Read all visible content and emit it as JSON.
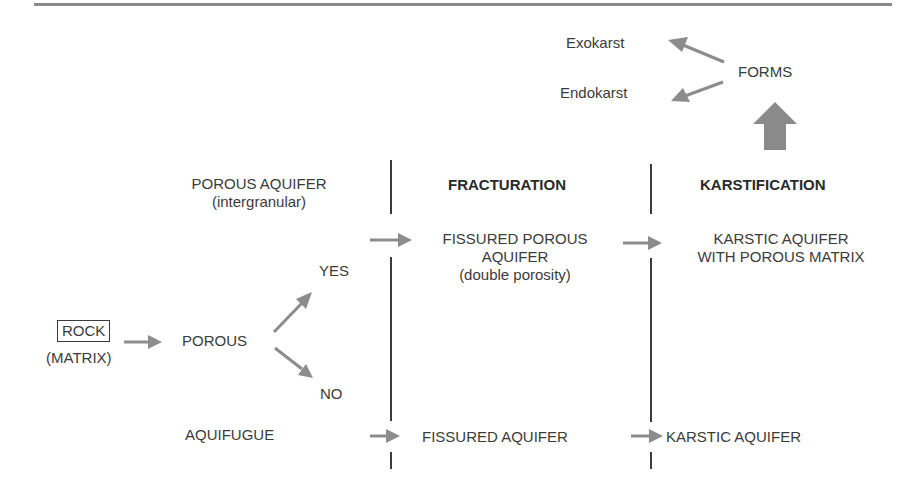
{
  "diagram": {
    "columns": {
      "fracturation": "FRACTURATION",
      "karstification": "KARSTIFICATION"
    },
    "forms": {
      "label": "FORMS",
      "outputs": [
        "Exokarst",
        "Endokarst"
      ]
    },
    "rock": {
      "label": "ROCK",
      "sublabel": "(MATRIX)"
    },
    "porous": {
      "label": "POROUS",
      "yes": "YES",
      "no": "NO"
    },
    "row_porous": {
      "base_label": "POROUS AQUIFER",
      "base_sublabel": "(intergranular)",
      "fractured_line1": "FISSURED POROUS",
      "fractured_line2": "AQUIFER",
      "fractured_sublabel": "(double porosity)",
      "karstic_line1": "KARSTIC AQUIFER",
      "karstic_line2": "WITH POROUS MATRIX"
    },
    "row_nonporous": {
      "base_label": "AQUIFUGUE",
      "fractured_label": "FISSURED AQUIFER",
      "karstic_label": "KARSTIC AQUIFER"
    },
    "colors": {
      "arrow": "#8c8c8c",
      "text": "#3b3b3b",
      "line": "#3c3c3c"
    }
  }
}
